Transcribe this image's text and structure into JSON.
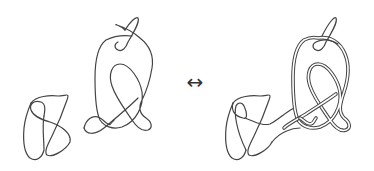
{
  "figure": {
    "left": {
      "description": "Two separate knot diagrams",
      "components": [
        "small-knot",
        "large-knot"
      ]
    },
    "relation_symbol": "↔",
    "right": {
      "description": "Combined knot diagram with doubled (parallel) strands joining the two components"
    },
    "colors": {
      "stroke": "#444444",
      "background": "#ffffff"
    }
  }
}
